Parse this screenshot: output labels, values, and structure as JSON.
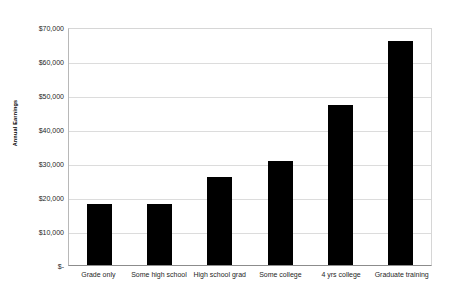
{
  "chart_data": {
    "type": "bar",
    "title": "",
    "xlabel": "",
    "ylabel": "Annual Earnings",
    "categories": [
      "Grade only",
      "Some high school",
      "High school grad",
      "Some college",
      "4 yrs college",
      "Graduate training"
    ],
    "values": [
      18000,
      18000,
      26000,
      30500,
      47000,
      66000
    ],
    "ylim": [
      0,
      70000
    ],
    "y_ticks": [
      0,
      10000,
      20000,
      30000,
      40000,
      50000,
      60000,
      70000
    ],
    "y_tick_labels": [
      "$-",
      "$10,000",
      "$20,000",
      "$30,000",
      "$40,000",
      "$50,000",
      "$60,000",
      "$70,000"
    ],
    "grid": true,
    "legend": false,
    "bar_color": "#000000",
    "gridline_color": "#dcdcdc",
    "background_color": "#ffffff"
  }
}
